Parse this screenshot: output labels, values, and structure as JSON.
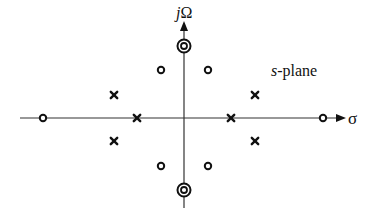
{
  "diagram": {
    "title": "s-plane",
    "title_italic_part": "s",
    "title_rest": "-plane",
    "axes": {
      "horizontal_label": "σ",
      "vertical_label_italic": "j",
      "vertical_label_rest": "Ω",
      "origin": [
        184,
        118
      ]
    },
    "poles": [
      {
        "x": 114,
        "y": 95
      },
      {
        "x": 255,
        "y": 95
      },
      {
        "x": 137,
        "y": 118
      },
      {
        "x": 231,
        "y": 118
      },
      {
        "x": 114,
        "y": 141
      },
      {
        "x": 255,
        "y": 141
      }
    ],
    "zeros": [
      {
        "x": 43,
        "y": 118
      },
      {
        "x": 323,
        "y": 118
      },
      {
        "x": 161,
        "y": 70
      },
      {
        "x": 208,
        "y": 70
      },
      {
        "x": 161,
        "y": 166
      },
      {
        "x": 208,
        "y": 166
      }
    ],
    "double_zeros": [
      {
        "x": 184,
        "y": 46
      },
      {
        "x": 184,
        "y": 190
      }
    ],
    "colors": {
      "ink": "#111111",
      "axis": "#333333"
    }
  }
}
